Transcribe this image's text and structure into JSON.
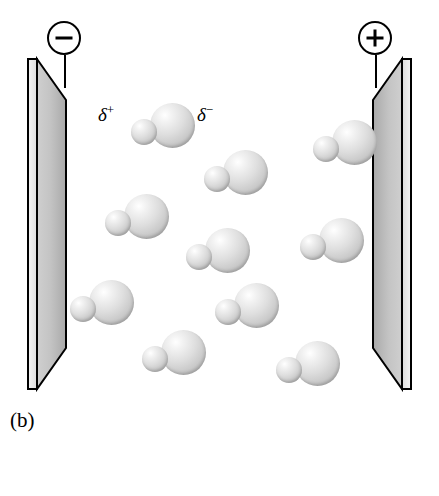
{
  "figure": {
    "panel_label": "(b)",
    "background_color": "#ffffff"
  },
  "terminals": [
    {
      "name": "negative",
      "symbol": "−",
      "x": 47,
      "y": 21,
      "lead_x": 64,
      "lead_top": 55,
      "lead_bottom": 88
    },
    {
      "name": "positive",
      "symbol": "+",
      "x": 358,
      "y": 21,
      "lead_x": 375,
      "lead_top": 55,
      "lead_bottom": 88
    }
  ],
  "plates": [
    {
      "name": "left-plate",
      "charge": "negative"
    },
    {
      "name": "right-plate",
      "charge": "positive"
    }
  ],
  "partial_charges": [
    {
      "label": "δ",
      "sign": "+",
      "x": 98,
      "y": 103,
      "points_to": "hydrogen"
    },
    {
      "label": "δ",
      "sign": "−",
      "x": 197,
      "y": 103,
      "points_to": "fluorine"
    }
  ],
  "molecules": [
    {
      "x": 131,
      "y": 103,
      "h_dx": 0,
      "h_dy": 16,
      "f_dx": 19,
      "f_dy": 0
    },
    {
      "x": 204,
      "y": 150,
      "h_dx": 0,
      "h_dy": 16,
      "f_dx": 19,
      "f_dy": 0
    },
    {
      "x": 105,
      "y": 194,
      "h_dx": 0,
      "h_dy": 16,
      "f_dx": 19,
      "f_dy": 0
    },
    {
      "x": 313,
      "y": 120,
      "h_dx": 0,
      "h_dy": 16,
      "f_dx": 19,
      "f_dy": 0
    },
    {
      "x": 186,
      "y": 228,
      "h_dx": 0,
      "h_dy": 16,
      "f_dx": 19,
      "f_dy": 0
    },
    {
      "x": 300,
      "y": 218,
      "h_dx": 0,
      "h_dy": 16,
      "f_dx": 19,
      "f_dy": 0
    },
    {
      "x": 70,
      "y": 280,
      "h_dx": 0,
      "h_dy": 16,
      "f_dx": 19,
      "f_dy": 0
    },
    {
      "x": 215,
      "y": 283,
      "h_dx": 0,
      "h_dy": 16,
      "f_dx": 19,
      "f_dy": 0
    },
    {
      "x": 142,
      "y": 330,
      "h_dx": 0,
      "h_dy": 16,
      "f_dx": 19,
      "f_dy": 0
    },
    {
      "x": 276,
      "y": 341,
      "h_dx": 0,
      "h_dy": 16,
      "f_dx": 19,
      "f_dy": 0
    }
  ],
  "legend": {
    "items": [
      {
        "name": "hydrogen",
        "label": "H",
        "sphere_size": "small",
        "sphere_x": 151,
        "sphere_y": 472,
        "label_x": 189,
        "label_y": 470
      },
      {
        "name": "fluorine",
        "label": "F",
        "sphere_size": "large",
        "sphere_x": 240,
        "sphere_y": 464,
        "label_x": 296,
        "label_y": 470
      }
    ]
  }
}
